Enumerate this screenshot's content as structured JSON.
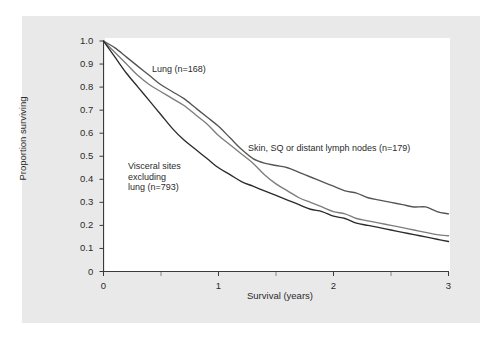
{
  "figure": {
    "background_color": "#ffffff",
    "panel_color": "#e9e9e9",
    "plot_color": "#ffffff"
  },
  "axes": {
    "xlabel": "Survival (years)",
    "ylabel": "Proportion surviving",
    "x_ticks": [
      "0",
      "1",
      "2",
      "3"
    ],
    "x_tick_values": [
      0,
      1,
      2,
      3
    ],
    "x_minor_tick_values": [
      0.5,
      1.5,
      2.5
    ],
    "y_ticks": [
      "0",
      "0.1",
      "0.2",
      "0.3",
      "0.4",
      "0.5",
      "0.6",
      "0.7",
      "0.8",
      "0.9",
      "1.0"
    ],
    "y_tick_values": [
      0,
      0.1,
      0.2,
      0.3,
      0.4,
      0.5,
      0.6,
      0.7,
      0.8,
      0.9,
      1.0
    ],
    "xlim": [
      0,
      3
    ],
    "ylim": [
      0,
      1.0
    ],
    "grid": false
  },
  "annotations": {
    "lung": "Lung (n=168)",
    "skin": "Skin, SQ or distant lymph nodes (n=179)",
    "visceral": "Visceral sites\nexcluding\nlung (n=793)"
  },
  "chart_data": {
    "type": "line",
    "title": "",
    "subtitle": "",
    "xlabel": "Survival (years)",
    "ylabel": "Proportion surviving",
    "xlim": [
      0,
      3
    ],
    "ylim": [
      0,
      1.0
    ],
    "grid": false,
    "legend_position": "inline-annotations",
    "x_unit": "years",
    "series": [
      {
        "name": "Skin, SQ or distant lymph nodes (n=179)",
        "n": 179,
        "color": "#555555",
        "label": "Skin, SQ or distant lymph nodes (n=179)",
        "x": [
          0.0,
          0.1,
          0.2,
          0.3,
          0.4,
          0.5,
          0.6,
          0.7,
          0.8,
          0.9,
          1.0,
          1.1,
          1.2,
          1.3,
          1.4,
          1.5,
          1.6,
          1.7,
          1.8,
          1.9,
          2.0,
          2.1,
          2.2,
          2.3,
          2.4,
          2.5,
          2.6,
          2.7,
          2.8,
          2.9,
          3.0
        ],
        "y": [
          1.0,
          0.97,
          0.93,
          0.89,
          0.85,
          0.81,
          0.78,
          0.75,
          0.71,
          0.67,
          0.63,
          0.58,
          0.53,
          0.49,
          0.47,
          0.46,
          0.45,
          0.43,
          0.41,
          0.39,
          0.37,
          0.35,
          0.34,
          0.32,
          0.31,
          0.3,
          0.29,
          0.28,
          0.28,
          0.26,
          0.25
        ]
      },
      {
        "name": "Lung (n=168)",
        "n": 168,
        "color": "#7d7d7d",
        "label": "Lung (n=168)",
        "x": [
          0.0,
          0.1,
          0.2,
          0.3,
          0.4,
          0.5,
          0.6,
          0.7,
          0.8,
          0.9,
          1.0,
          1.1,
          1.2,
          1.3,
          1.4,
          1.5,
          1.6,
          1.7,
          1.8,
          1.9,
          2.0,
          2.1,
          2.2,
          2.3,
          2.4,
          2.5,
          2.6,
          2.7,
          2.8,
          2.9,
          3.0
        ],
        "y": [
          1.0,
          0.95,
          0.9,
          0.85,
          0.81,
          0.78,
          0.75,
          0.72,
          0.68,
          0.64,
          0.59,
          0.55,
          0.51,
          0.47,
          0.42,
          0.38,
          0.35,
          0.32,
          0.3,
          0.28,
          0.26,
          0.25,
          0.23,
          0.22,
          0.21,
          0.2,
          0.19,
          0.18,
          0.17,
          0.16,
          0.155
        ]
      },
      {
        "name": "Visceral sites excluding lung (n=793)",
        "n": 793,
        "color": "#2b2b2b",
        "label": "Visceral sites excluding lung (n=793)",
        "x": [
          0.0,
          0.1,
          0.2,
          0.3,
          0.4,
          0.5,
          0.6,
          0.7,
          0.8,
          0.9,
          1.0,
          1.1,
          1.2,
          1.3,
          1.4,
          1.5,
          1.6,
          1.7,
          1.8,
          1.9,
          2.0,
          2.1,
          2.2,
          2.3,
          2.4,
          2.5,
          2.6,
          2.7,
          2.8,
          2.9,
          3.0
        ],
        "y": [
          1.0,
          0.93,
          0.86,
          0.8,
          0.74,
          0.68,
          0.62,
          0.57,
          0.53,
          0.49,
          0.45,
          0.42,
          0.39,
          0.37,
          0.35,
          0.33,
          0.31,
          0.29,
          0.27,
          0.26,
          0.24,
          0.23,
          0.21,
          0.2,
          0.19,
          0.18,
          0.17,
          0.16,
          0.15,
          0.14,
          0.13
        ]
      }
    ]
  }
}
